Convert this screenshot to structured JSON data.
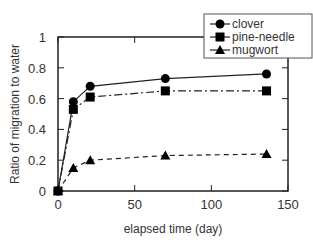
{
  "chart_data": {
    "type": "line",
    "title": "",
    "xlabel": "elapsed time (day)",
    "ylabel": "Ratio of migration to water",
    "xlim": [
      0,
      150
    ],
    "ylim": [
      0,
      1
    ],
    "xticks": [
      0,
      50,
      100,
      150
    ],
    "yticks": [
      0,
      0.2,
      0.4,
      0.6,
      0.8,
      1
    ],
    "ytick_labels": [
      "0",
      "0.2",
      "0.4",
      "0.6",
      "0.8",
      "1"
    ],
    "legend_position": "top-right",
    "series": [
      {
        "name": "clover",
        "marker": "circle",
        "dash": "solid",
        "x": [
          0,
          10,
          21,
          70,
          136
        ],
        "values": [
          0,
          0.58,
          0.68,
          0.73,
          0.76
        ]
      },
      {
        "name": "pine-needle",
        "marker": "square",
        "dash": "dashdot",
        "x": [
          0,
          10,
          21,
          70,
          136
        ],
        "values": [
          0,
          0.53,
          0.61,
          0.65,
          0.65
        ]
      },
      {
        "name": "mugwort",
        "marker": "triangle",
        "dash": "dashed",
        "x": [
          0,
          10,
          21,
          70,
          136
        ],
        "values": [
          0,
          0.15,
          0.2,
          0.23,
          0.24
        ]
      }
    ]
  }
}
